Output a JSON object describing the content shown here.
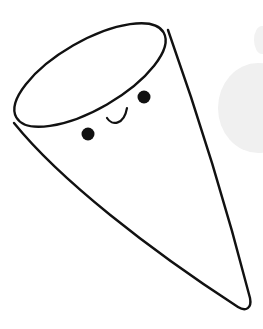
{
  "illustration": {
    "subject": "cone-character",
    "colors": {
      "background": "#ffffff",
      "outline": "#111111",
      "fill": "#ffffff",
      "face": "#111111",
      "shadow_blob": "#f0f0f0"
    },
    "face": {
      "eyes": 2,
      "mouth": "smile"
    }
  }
}
